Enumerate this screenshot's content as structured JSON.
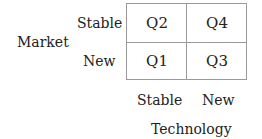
{
  "diagram": {
    "type": "2x2 matrix",
    "row_axis": {
      "title": "Market",
      "labels": [
        "Stable",
        "New"
      ]
    },
    "column_axis": {
      "title": "Technology",
      "labels": [
        "Stable",
        "New"
      ]
    },
    "cells": [
      [
        "Q2",
        "Q4"
      ],
      [
        "Q1",
        "Q3"
      ]
    ]
  }
}
